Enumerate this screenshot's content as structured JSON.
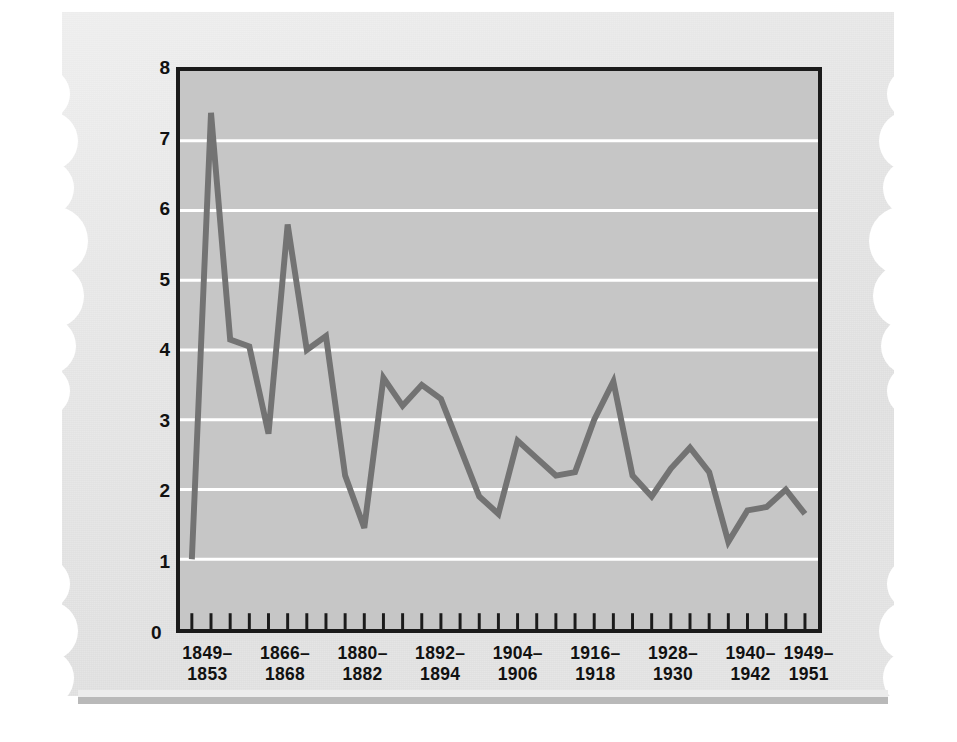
{
  "chart_data": {
    "type": "line",
    "title": "",
    "subtitle": "",
    "xlabel": "",
    "ylabel": "MURDER PER 100,000 POPULATION",
    "ylim": [
      0,
      8
    ],
    "ytick_labels": [
      "0",
      "1",
      "2",
      "3",
      "4",
      "5",
      "6",
      "7",
      "8"
    ],
    "ytick_values": [
      0,
      1,
      2,
      3,
      4,
      5,
      6,
      7,
      8
    ],
    "grid": "horizontal-white-gridlines",
    "legend": "none",
    "line_color": "#737373",
    "plot_background": "#c6c6c6",
    "xtick_labels": [
      {
        "l1": "1849–",
        "l2": "1853"
      },
      {
        "l1": "1866–",
        "l2": "1868"
      },
      {
        "l1": "1880–",
        "l2": "1882"
      },
      {
        "l1": "1892–",
        "l2": "1894"
      },
      {
        "l1": "1904–",
        "l2": "1906"
      },
      {
        "l1": "1916–",
        "l2": "1918"
      },
      {
        "l1": "1928–",
        "l2": "1930"
      },
      {
        "l1": "1940–",
        "l2": "1942"
      },
      {
        "l1": "1949–",
        "l2": "1951"
      }
    ],
    "x_index": [
      0,
      1,
      2,
      3,
      4,
      5,
      6,
      7,
      8,
      9,
      10,
      11,
      12,
      13,
      14,
      15,
      16,
      17,
      18,
      19,
      20,
      21,
      22,
      23,
      24,
      25,
      26,
      27,
      28,
      29,
      30,
      31,
      32
    ],
    "values": [
      1.0,
      7.4,
      4.15,
      4.05,
      2.8,
      5.8,
      4.0,
      4.2,
      2.2,
      1.45,
      3.6,
      3.2,
      3.5,
      3.3,
      2.6,
      1.9,
      1.65,
      2.7,
      2.45,
      2.2,
      2.25,
      3.0,
      3.55,
      2.2,
      1.9,
      2.3,
      2.6,
      2.25,
      1.25,
      1.7,
      1.75,
      2.0,
      1.65
    ],
    "series_name": "Murder rate"
  },
  "page": {
    "paper_edge": "scalloped-torn-edges"
  }
}
